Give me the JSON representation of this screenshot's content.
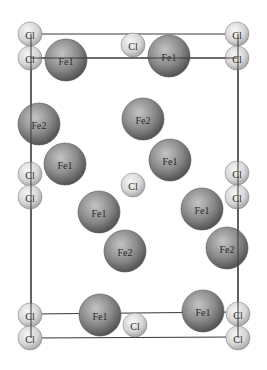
{
  "diagram": {
    "type": "crystal-structure-projection",
    "colors": {
      "background": "#ffffff",
      "line": "#3a3a3a",
      "fe_light": "#b8b8b8",
      "fe_dark": "#505050",
      "cl_light": "#f2f2f2",
      "cl_dark": "#a8a8a8"
    },
    "lines": [
      {
        "x1": 30,
        "y1": 34,
        "x2": 237,
        "y2": 34
      },
      {
        "x1": 30,
        "y1": 58,
        "x2": 237,
        "y2": 58
      },
      {
        "x1": 31,
        "y1": 34,
        "x2": 31,
        "y2": 338
      },
      {
        "x1": 238,
        "y1": 34,
        "x2": 238,
        "y2": 338
      },
      {
        "x1": 30,
        "y1": 314,
        "x2": 238,
        "y2": 312
      },
      {
        "x1": 30,
        "y1": 338,
        "x2": 238,
        "y2": 337
      }
    ],
    "atoms": [
      {
        "label": "Cl",
        "element": "Cl",
        "x": 30,
        "y": 34
      },
      {
        "label": "Cl",
        "element": "Cl",
        "x": 237,
        "y": 34
      },
      {
        "label": "Cl",
        "element": "Cl",
        "x": 133,
        "y": 45
      },
      {
        "label": "Cl",
        "element": "Cl",
        "x": 30,
        "y": 58
      },
      {
        "label": "Cl",
        "element": "Cl",
        "x": 237,
        "y": 58
      },
      {
        "label": "Fe1",
        "element": "Fe",
        "x": 66,
        "y": 60
      },
      {
        "label": "Fe1",
        "element": "Fe",
        "x": 169,
        "y": 56
      },
      {
        "label": "Fe2",
        "element": "Fe",
        "x": 39,
        "y": 124
      },
      {
        "label": "Fe2",
        "element": "Fe",
        "x": 143,
        "y": 119
      },
      {
        "label": "Cl",
        "element": "Cl",
        "x": 30,
        "y": 174
      },
      {
        "label": "Cl",
        "element": "Cl",
        "x": 30,
        "y": 197
      },
      {
        "label": "Fe1",
        "element": "Fe",
        "x": 65,
        "y": 164
      },
      {
        "label": "Fe1",
        "element": "Fe",
        "x": 170,
        "y": 160
      },
      {
        "label": "Cl",
        "element": "Cl",
        "x": 133,
        "y": 185
      },
      {
        "label": "Cl",
        "element": "Cl",
        "x": 237,
        "y": 173
      },
      {
        "label": "Cl",
        "element": "Cl",
        "x": 237,
        "y": 197
      },
      {
        "label": "Fe1",
        "element": "Fe",
        "x": 99,
        "y": 212
      },
      {
        "label": "Fe1",
        "element": "Fe",
        "x": 202,
        "y": 209
      },
      {
        "label": "Fe2",
        "element": "Fe",
        "x": 125,
        "y": 251
      },
      {
        "label": "Fe2",
        "element": "Fe",
        "x": 227,
        "y": 248
      },
      {
        "label": "Cl",
        "element": "Cl",
        "x": 30,
        "y": 315
      },
      {
        "label": "Cl",
        "element": "Cl",
        "x": 30,
        "y": 338
      },
      {
        "label": "Fe1",
        "element": "Fe",
        "x": 100,
        "y": 315
      },
      {
        "label": "Fe1",
        "element": "Fe",
        "x": 203,
        "y": 311
      },
      {
        "label": "Cl",
        "element": "Cl",
        "x": 135,
        "y": 325
      },
      {
        "label": "Cl",
        "element": "Cl",
        "x": 238,
        "y": 314
      },
      {
        "label": "Cl",
        "element": "Cl",
        "x": 238,
        "y": 338
      }
    ],
    "radii": {
      "Fe": 21,
      "Cl": 12
    }
  }
}
